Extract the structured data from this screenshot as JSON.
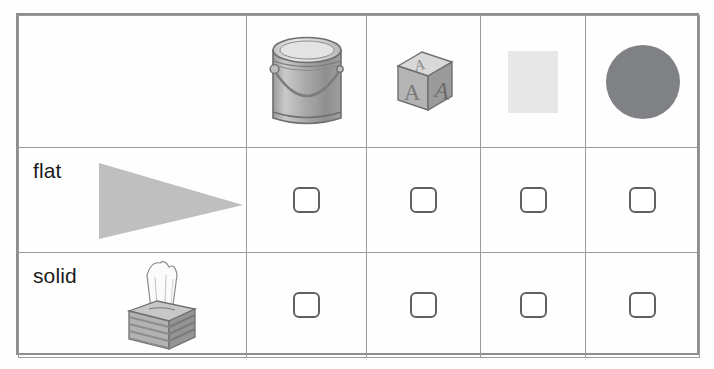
{
  "worksheet": {
    "type": "flat-or-solid-sorting-table",
    "columns": [
      {
        "key": "label",
        "header_label": ""
      },
      {
        "key": "item1",
        "header_label": "paint-can",
        "icon": "paint-can-image"
      },
      {
        "key": "item2",
        "header_label": "alphabet-block",
        "icon": "alphabet-block-image",
        "letters": [
          "A",
          "A",
          "A"
        ]
      },
      {
        "key": "item3",
        "header_label": "gray-square",
        "icon": "square-shape",
        "color": "#e7e7e7"
      },
      {
        "key": "item4",
        "header_label": "gray-circle",
        "icon": "circle-shape",
        "color": "#808184"
      }
    ],
    "rows": [
      {
        "label": "flat",
        "illustration": "gray-triangle",
        "illustration_color": "#bfbfbf",
        "checkboxes": [
          {
            "checked": false
          },
          {
            "checked": false
          },
          {
            "checked": false
          },
          {
            "checked": false
          }
        ]
      },
      {
        "label": "solid",
        "illustration": "tissue-box",
        "checkboxes": [
          {
            "checked": false
          },
          {
            "checked": false
          },
          {
            "checked": false
          },
          {
            "checked": false
          }
        ]
      }
    ],
    "colors": {
      "border": "#9a9a9a",
      "outer_border": "#8e8e8e",
      "checkbox_border": "#5f6066",
      "text": "#1b1b1b",
      "square_fill": "#e7e7e7",
      "circle_fill": "#808184",
      "triangle_fill": "#bfbfbf",
      "page_background": "#fdfdfd"
    }
  }
}
